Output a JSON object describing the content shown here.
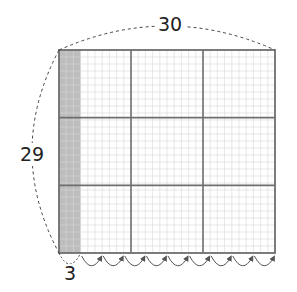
{
  "diagram": {
    "labels": {
      "top_width": "30",
      "left_height": "29",
      "bottom_shaded": "3"
    },
    "grid": {
      "columns_units": 30,
      "rows_units": 29,
      "major_divisions": 3,
      "shaded_units": 3,
      "arrow_jumps": 9
    },
    "colors": {
      "border": "#6e6e6e",
      "minor_line": "#d6d6d6",
      "shade": "#bdbdbd",
      "dashed": "#444444",
      "arrow": "#555555"
    }
  }
}
